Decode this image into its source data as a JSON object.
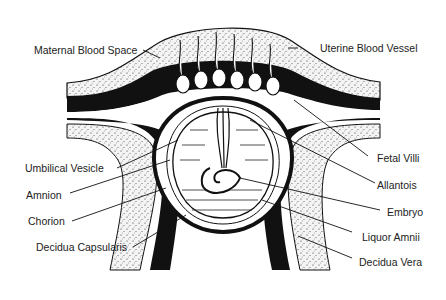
{
  "diagram": {
    "title": "",
    "colors": {
      "ink": "#111111",
      "stipple_bg": "#f2f2f2",
      "background": "#ffffff"
    },
    "labels_left": [
      {
        "id": "maternal-blood-space",
        "text": "Maternal Blood Space"
      },
      {
        "id": "umbilical-vesicle",
        "text": "Umbilical Vesicle"
      },
      {
        "id": "amnion",
        "text": "Amnion"
      },
      {
        "id": "chorion",
        "text": "Chorion"
      },
      {
        "id": "decidua-capsularis",
        "text": "Decidua Capsularis"
      }
    ],
    "labels_right": [
      {
        "id": "uterine-blood-vessel",
        "text": "Uterine Blood Vessel"
      },
      {
        "id": "fetal-villi",
        "text": "Fetal Villi"
      },
      {
        "id": "allantois",
        "text": "Allantois"
      },
      {
        "id": "embryo",
        "text": "Embryo"
      },
      {
        "id": "liquor-amnii",
        "text": "Liquor Amnii"
      },
      {
        "id": "decidua-vera",
        "text": "Decidua Vera"
      }
    ]
  }
}
